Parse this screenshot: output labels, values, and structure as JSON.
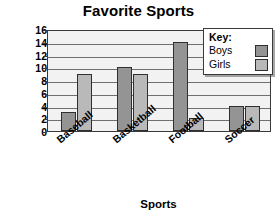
{
  "chart_data": {
    "type": "bar",
    "title": "Favorite Sports",
    "xlabel": "Sports",
    "ylabel": "Number of Students",
    "categories": [
      "Baseball",
      "Basketball",
      "Football",
      "Soccer"
    ],
    "series": [
      {
        "name": "Boys",
        "values": [
          3,
          10,
          14,
          4
        ],
        "color": "#949494"
      },
      {
        "name": "Girls",
        "values": [
          9,
          9,
          2,
          4
        ],
        "color": "#b9b9b9"
      }
    ],
    "ylim": [
      0,
      16
    ],
    "ytick_step": 2,
    "yticks": [
      0,
      2,
      4,
      6,
      8,
      10,
      12,
      14,
      16
    ],
    "ytick_labels": [
      "0",
      "2",
      "4",
      "6",
      "8",
      "10",
      "12",
      "14",
      "16"
    ],
    "grid": true,
    "grid_axis": "y",
    "legend_position": "top-right",
    "legend_title": "Key:",
    "plot_background": "#f2f2f2",
    "axis_color": "#3a3a3a"
  }
}
